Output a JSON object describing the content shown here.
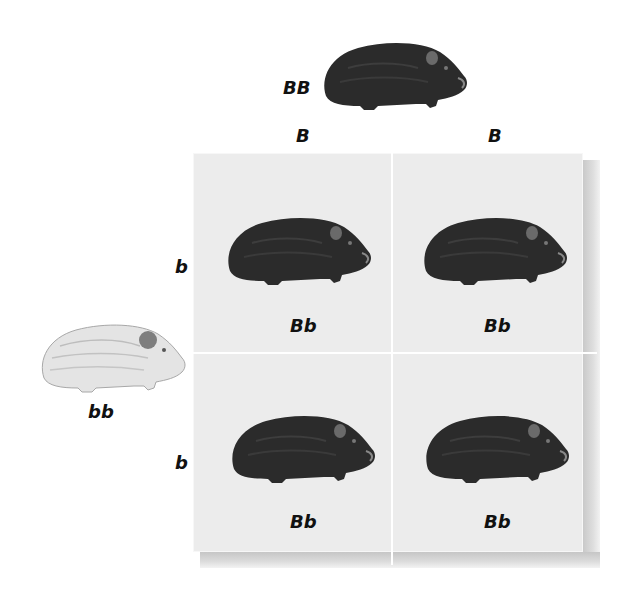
{
  "diagram": {
    "type": "punnett-square",
    "parent_top": {
      "genotype": "BB",
      "phenotype": "black guinea pig"
    },
    "parent_left": {
      "genotype": "bb",
      "phenotype": "white guinea pig"
    },
    "column_alleles": [
      "B",
      "B"
    ],
    "row_alleles": [
      "b",
      "b"
    ],
    "cells": [
      {
        "row": 0,
        "col": 0,
        "genotype": "Bb",
        "phenotype": "black guinea pig"
      },
      {
        "row": 0,
        "col": 1,
        "genotype": "Bb",
        "phenotype": "black guinea pig"
      },
      {
        "row": 1,
        "col": 0,
        "genotype": "Bb",
        "phenotype": "black guinea pig"
      },
      {
        "row": 1,
        "col": 1,
        "genotype": "Bb",
        "phenotype": "black guinea pig"
      }
    ],
    "colors": {
      "black_fur": "#2b2b2b",
      "white_fur": "#e2e2e2",
      "cell_background": "#ebebeb",
      "grid_lines": "#ffffff",
      "text": "#111111"
    }
  }
}
